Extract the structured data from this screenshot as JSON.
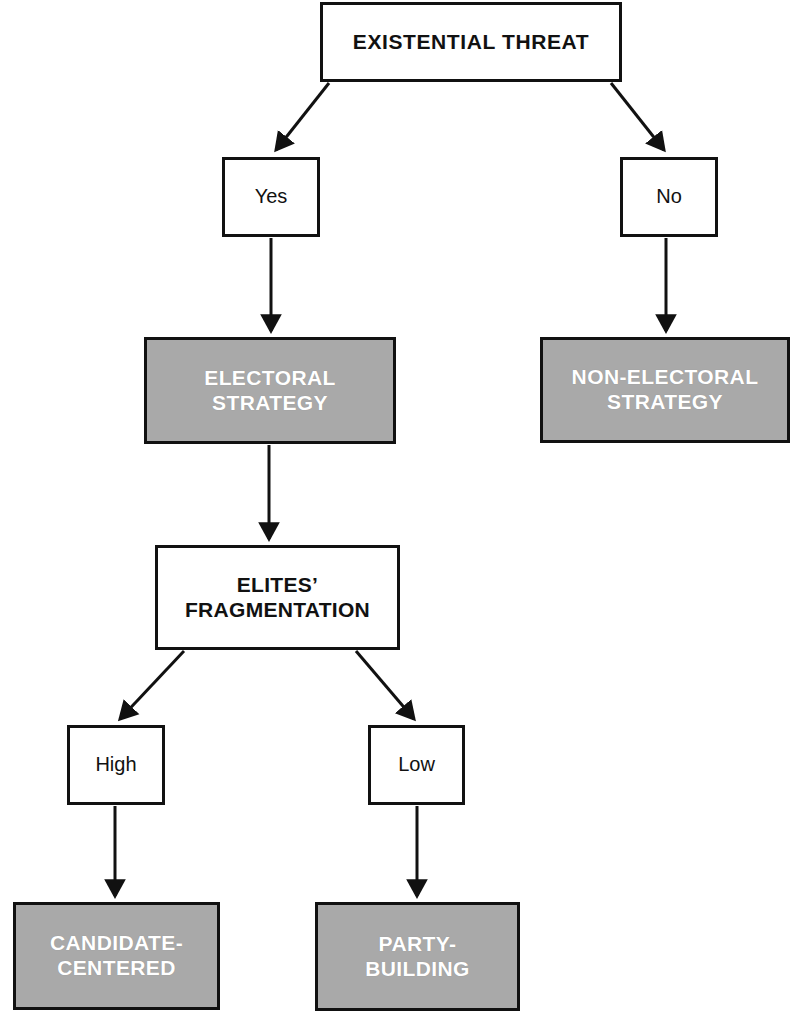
{
  "diagram": {
    "title": "EXISTENTIAL THREAT",
    "type": "flowchart",
    "colors": {
      "shaded_fill": "#a9a9a9",
      "shaded_text": "#ffffff",
      "plain_fill": "#ffffff",
      "stroke": "#111111"
    },
    "nodes": [
      {
        "id": "existential-threat",
        "label": "EXISTENTIAL THREAT",
        "style": "plain"
      },
      {
        "id": "yes",
        "label": "Yes",
        "style": "plain"
      },
      {
        "id": "no",
        "label": "No",
        "style": "plain"
      },
      {
        "id": "electoral-strategy",
        "label": "ELECTORAL\nSTRATEGY",
        "style": "shaded"
      },
      {
        "id": "non-electoral-strategy",
        "label": "NON-ELECTORAL\nSTRATEGY",
        "style": "shaded"
      },
      {
        "id": "elites-fragmentation",
        "label": "ELITES’\nFRAGMENTATION",
        "style": "plain"
      },
      {
        "id": "high",
        "label": "High",
        "style": "plain"
      },
      {
        "id": "low",
        "label": "Low",
        "style": "plain"
      },
      {
        "id": "candidate-centered",
        "label": "CANDIDATE-\nCENTERED",
        "style": "shaded"
      },
      {
        "id": "party-building",
        "label": "PARTY-\nBUILDING",
        "style": "shaded"
      }
    ],
    "edges": [
      {
        "from": "existential-threat",
        "to": "yes",
        "kind": "diagonal"
      },
      {
        "from": "existential-threat",
        "to": "no",
        "kind": "diagonal"
      },
      {
        "from": "yes",
        "to": "electoral-strategy",
        "kind": "vertical"
      },
      {
        "from": "no",
        "to": "non-electoral-strategy",
        "kind": "vertical"
      },
      {
        "from": "electoral-strategy",
        "to": "elites-fragmentation",
        "kind": "vertical"
      },
      {
        "from": "elites-fragmentation",
        "to": "high",
        "kind": "diagonal"
      },
      {
        "from": "elites-fragmentation",
        "to": "low",
        "kind": "diagonal"
      },
      {
        "from": "high",
        "to": "candidate-centered",
        "kind": "vertical"
      },
      {
        "from": "low",
        "to": "party-building",
        "kind": "vertical"
      }
    ]
  }
}
